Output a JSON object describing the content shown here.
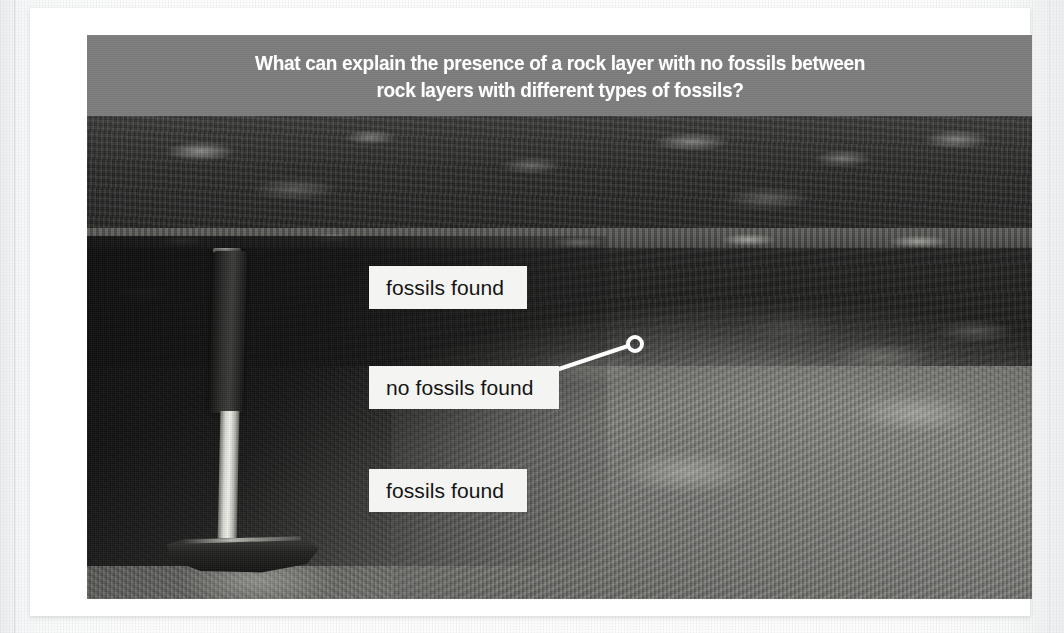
{
  "figure": {
    "header": {
      "question": "What can explain the presence of a rock layer with no fossils between\nrock layers with different types of fossils?",
      "background_color": "#7c7c7c",
      "text_color": "#ffffff"
    },
    "photo": {
      "alt_description": "Photograph of an excavated rock outcrop showing horizontal sedimentary layers, with a geologist's rock hammer standing upright at the left for scale.",
      "label_background": "#f4f4f2",
      "label_text_color": "#141414",
      "leader_color": "#ffffff"
    },
    "labels": [
      {
        "name": "fossils-found-upper",
        "text": "fossils found"
      },
      {
        "name": "no-fossils-found-middle",
        "text": "no fossils found"
      },
      {
        "name": "fossils-found-lower",
        "text": "fossils found"
      }
    ]
  }
}
